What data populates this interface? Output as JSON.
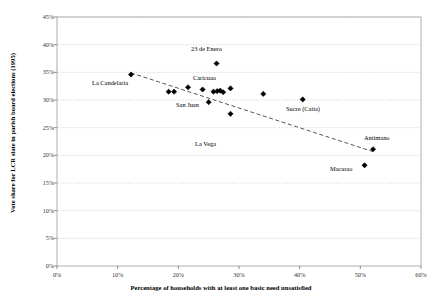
{
  "chart_data": {
    "type": "scatter",
    "title": "",
    "xlabel": "Percentage of households with at least one basic need unsatisfied",
    "ylabel": "Vote share for LCR slate in parish board elections (1995)",
    "xlim": [
      0,
      60
    ],
    "ylim": [
      0,
      45
    ],
    "xticks": [
      "0%",
      "10%",
      "20%",
      "30%",
      "40%",
      "50%",
      "60%"
    ],
    "xtick_values": [
      0,
      10,
      20,
      30,
      40,
      50,
      60
    ],
    "yticks": [
      "0%",
      "5%",
      "10%",
      "15%",
      "20%",
      "25%",
      "30%",
      "35%",
      "40%",
      "45%"
    ],
    "ytick_values": [
      0,
      5,
      10,
      15,
      20,
      25,
      30,
      35,
      40,
      45
    ],
    "grid": "horizontal-dotted",
    "legend": "none",
    "marker": "diamond",
    "marker_color": "#000000",
    "trendline": {
      "style": "dashed",
      "color": "#555555",
      "x_start": 12.2,
      "y_start": 34.9,
      "x_end": 52.0,
      "y_end": 20.7
    },
    "points": [
      {
        "x": 12.2,
        "y": 34.6,
        "label": "La Candelaria"
      },
      {
        "x": 18.4,
        "y": 31.5,
        "label": ""
      },
      {
        "x": 19.3,
        "y": 31.5,
        "label": ""
      },
      {
        "x": 21.6,
        "y": 32.3,
        "label": ""
      },
      {
        "x": 24.0,
        "y": 31.9,
        "label": ""
      },
      {
        "x": 25.8,
        "y": 31.5,
        "label": "Caricuao"
      },
      {
        "x": 26.4,
        "y": 31.6,
        "label": ""
      },
      {
        "x": 26.9,
        "y": 31.7,
        "label": ""
      },
      {
        "x": 27.4,
        "y": 31.4,
        "label": ""
      },
      {
        "x": 28.6,
        "y": 32.1,
        "label": ""
      },
      {
        "x": 25.0,
        "y": 29.6,
        "label": "San Juan"
      },
      {
        "x": 26.3,
        "y": 36.6,
        "label": "23 de Enero"
      },
      {
        "x": 28.6,
        "y": 27.5,
        "label": "La Vega"
      },
      {
        "x": 34.0,
        "y": 31.1,
        "label": ""
      },
      {
        "x": 40.5,
        "y": 30.1,
        "label": "Sucre (Catia)"
      },
      {
        "x": 52.1,
        "y": 21.1,
        "label": "Antimano"
      },
      {
        "x": 50.7,
        "y": 18.2,
        "label": "Macarao"
      }
    ],
    "annotations": [
      {
        "text": "La Candelaria",
        "x_px": 92,
        "y_px": 79
      },
      {
        "text": "23 de Enero",
        "x_px": 191,
        "y_px": 45
      },
      {
        "text": "Caricuao",
        "x_px": 193,
        "y_px": 74
      },
      {
        "text": "San Juan",
        "x_px": 176,
        "y_px": 101
      },
      {
        "text": "La Vega",
        "x_px": 195,
        "y_px": 140
      },
      {
        "text": "Sucre (Catia)",
        "x_px": 286,
        "y_px": 105
      },
      {
        "text": "Antimano",
        "x_px": 364,
        "y_px": 134
      },
      {
        "text": "Macarao",
        "x_px": 330,
        "y_px": 165
      }
    ]
  }
}
